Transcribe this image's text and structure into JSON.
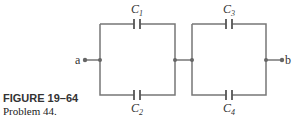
{
  "figure": {
    "label": "FIGURE 19–64",
    "caption": "Problem 44."
  },
  "circuit": {
    "terminals": {
      "left": "a",
      "right": "b"
    },
    "capacitors": [
      {
        "name": "C",
        "sub": "1"
      },
      {
        "name": "C",
        "sub": "2"
      },
      {
        "name": "C",
        "sub": "3"
      },
      {
        "name": "C",
        "sub": "4"
      }
    ],
    "wire_color": "#777777"
  }
}
